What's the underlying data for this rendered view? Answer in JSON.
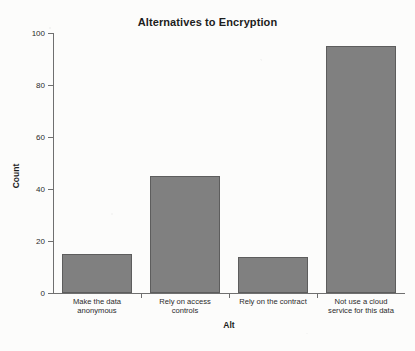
{
  "chart_data": {
    "type": "bar",
    "title": "Alternatives to Encryption",
    "xlabel": "Alt",
    "ylabel": "Count",
    "categories": [
      "Make the data anonymous",
      "Rely on access controls",
      "Rely on the contract",
      "Not use a cloud service for this data"
    ],
    "category_lines": [
      [
        "Make the data",
        "anonymous"
      ],
      [
        "Rely on access",
        "controls"
      ],
      [
        "Rely on the contract",
        ""
      ],
      [
        "Not use a cloud",
        "service for this data"
      ]
    ],
    "values": [
      15,
      45,
      14,
      95
    ],
    "ylim": [
      0,
      100
    ],
    "yticks": [
      0,
      20,
      40,
      60,
      80,
      100
    ],
    "ytick_labels": [
      "0",
      "20",
      "40",
      "60",
      "80",
      "100"
    ],
    "grid": false,
    "legend": null,
    "bar_color": "#808080",
    "bar_edge_color": "#5d5d5d",
    "axis_color": "#6f6f6f",
    "background_color": "#fcfcfb"
  }
}
